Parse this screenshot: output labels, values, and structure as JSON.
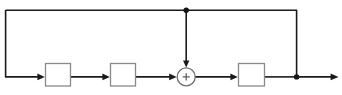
{
  "diagram": {
    "canvas": {
      "width": 342,
      "height": 95,
      "background": "#ffffff"
    },
    "colors": {
      "wire": "#1a1a1a",
      "block_border": "#8a8a8a",
      "block_fill": "#ffffff",
      "sum_border": "#6f6f6f",
      "node_dot": "#141414"
    },
    "blocks": [
      {
        "id": "block-1",
        "label": "",
        "x": 45,
        "y": 63,
        "width": 26,
        "height": 23
      },
      {
        "id": "block-2",
        "label": "",
        "x": 110,
        "y": 63,
        "width": 26,
        "height": 23
      },
      {
        "id": "block-3",
        "label": "",
        "x": 238,
        "y": 63,
        "width": 27,
        "height": 23
      }
    ],
    "summing_junction": {
      "id": "sum-1",
      "symbol": "+",
      "cx": 186,
      "cy": 77,
      "r": 9,
      "inputs": [
        "left",
        "top"
      ],
      "outputs": [
        "right"
      ]
    },
    "nodes": [
      {
        "id": "node-top-tap",
        "cx": 186,
        "cy": 10,
        "r": 2.6
      },
      {
        "id": "node-output-tap",
        "cx": 297,
        "cy": 77,
        "r": 2.6
      }
    ],
    "signal_path_labels": {
      "forward": "forward path",
      "feedback_outer": "outer feedback loop",
      "feedback_inner": "inner feedforward tap"
    }
  }
}
